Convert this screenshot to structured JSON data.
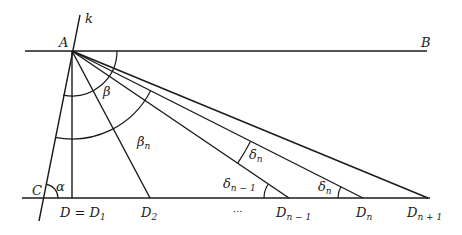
{
  "diagram": {
    "colors": {
      "stroke": "#1a1a1a",
      "background": "#ffffff"
    },
    "points": {
      "A": {
        "label": "A",
        "x": 72,
        "y": 51
      },
      "B": {
        "label": "B",
        "x": 427,
        "y": 51
      },
      "C": {
        "label": "C",
        "x": 44,
        "y": 198
      },
      "D1": {
        "label_main": "D = D",
        "label_sub": "1",
        "x": 72,
        "y": 198
      },
      "D2": {
        "label_main": "D",
        "label_sub": "2",
        "x": 150,
        "y": 198
      },
      "Dn_minus_1": {
        "label_main": "D",
        "label_sub": "n − 1",
        "x": 289,
        "y": 198
      },
      "Dn": {
        "label_main": "D",
        "label_sub": "n",
        "x": 363,
        "y": 198
      },
      "Dn_plus_1": {
        "label_main": "D",
        "label_sub": "n + 1",
        "x": 428,
        "y": 198
      }
    },
    "lines": {
      "k": {
        "label": "k"
      },
      "ellipsis": "..."
    },
    "angles": {
      "alpha": {
        "label": "α"
      },
      "beta": {
        "label": "β"
      },
      "beta_n": {
        "label_main": "β",
        "label_sub": "n"
      },
      "delta_n_upper": {
        "label_main": "δ",
        "label_sub": "n"
      },
      "delta_n_minus_1": {
        "label_main": "δ",
        "label_sub": "n − 1"
      },
      "delta_n_lower": {
        "label_main": "δ",
        "label_sub": "n"
      }
    }
  }
}
